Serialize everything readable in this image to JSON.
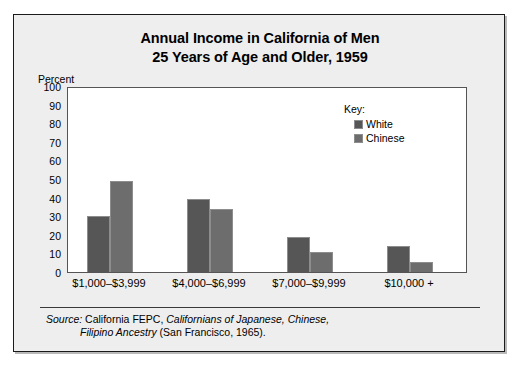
{
  "title": {
    "line1": "Annual Income in California of Men",
    "line2": "25 Years of Age and Older, 1959"
  },
  "axis": {
    "unit_label": "Percent",
    "yticks": [
      "100",
      "90",
      "80",
      "70",
      "60",
      "50",
      "40",
      "30",
      "20",
      "10",
      "0"
    ]
  },
  "legend": {
    "title": "Key:",
    "entries": [
      {
        "label": "White",
        "color": "#565656"
      },
      {
        "label": "Chinese",
        "color": "#6d6d6d"
      }
    ]
  },
  "source": {
    "label": "Source:",
    "text_before_italic": "California FEPC, ",
    "italic_line1": "Californians of Japanese, Chinese,",
    "italic_line2": "Filipino Ancestry",
    "text_after_italic": " (San Francisco, 1965)."
  },
  "chart_data": {
    "type": "bar",
    "title": "Annual Income in California of Men 25 Years of Age and Older, 1959",
    "xlabel": "",
    "ylabel": "Percent",
    "ylim": [
      0,
      100
    ],
    "ytick_step": 10,
    "grid": false,
    "legend_position": "inside-top-right",
    "categories": [
      "$1,000–$3,999",
      "$4,000–$6,999",
      "$7,000–$9,999",
      "$10,000 +"
    ],
    "series": [
      {
        "name": "White",
        "color": "#565656",
        "values": [
          30,
          39.5,
          19,
          14
        ]
      },
      {
        "name": "Chinese",
        "color": "#6d6d6d",
        "values": [
          49,
          34,
          11,
          5.5
        ]
      }
    ]
  }
}
